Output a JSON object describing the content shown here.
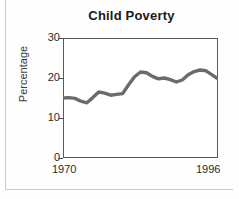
{
  "figure": {
    "title": "Child Poverty",
    "ylabel": "Percentage",
    "ytick_labels": [
      "30",
      "20",
      "10",
      "0"
    ],
    "xtick_labels": [
      "1970",
      "1996"
    ],
    "line_color": "#6b6b6b",
    "frame_color": "#5a5a5a",
    "text_color": "#2b2b2b"
  },
  "chart_data": {
    "type": "line",
    "title": "Child Poverty",
    "xlabel": "",
    "ylabel": "Percentage",
    "xlim": [
      1970,
      1996
    ],
    "ylim": [
      0,
      30
    ],
    "yticks": [
      0,
      10,
      20,
      30
    ],
    "xticks": [
      1970,
      1996
    ],
    "grid": false,
    "legend": null,
    "series": [
      {
        "name": "Child poverty rate",
        "x": [
          1970,
          1971,
          1972,
          1973,
          1974,
          1975,
          1976,
          1977,
          1978,
          1979,
          1980,
          1981,
          1982,
          1983,
          1984,
          1985,
          1986,
          1987,
          1988,
          1989,
          1990,
          1991,
          1992,
          1993,
          1994,
          1995,
          1996
        ],
        "values": [
          15.0,
          15.1,
          14.9,
          14.2,
          13.8,
          15.1,
          16.5,
          16.2,
          15.7,
          15.9,
          16.1,
          18.3,
          20.3,
          21.5,
          21.3,
          20.4,
          19.8,
          20.0,
          19.6,
          19.0,
          19.5,
          20.8,
          21.6,
          22.0,
          21.8,
          20.8,
          19.8
        ]
      }
    ]
  }
}
